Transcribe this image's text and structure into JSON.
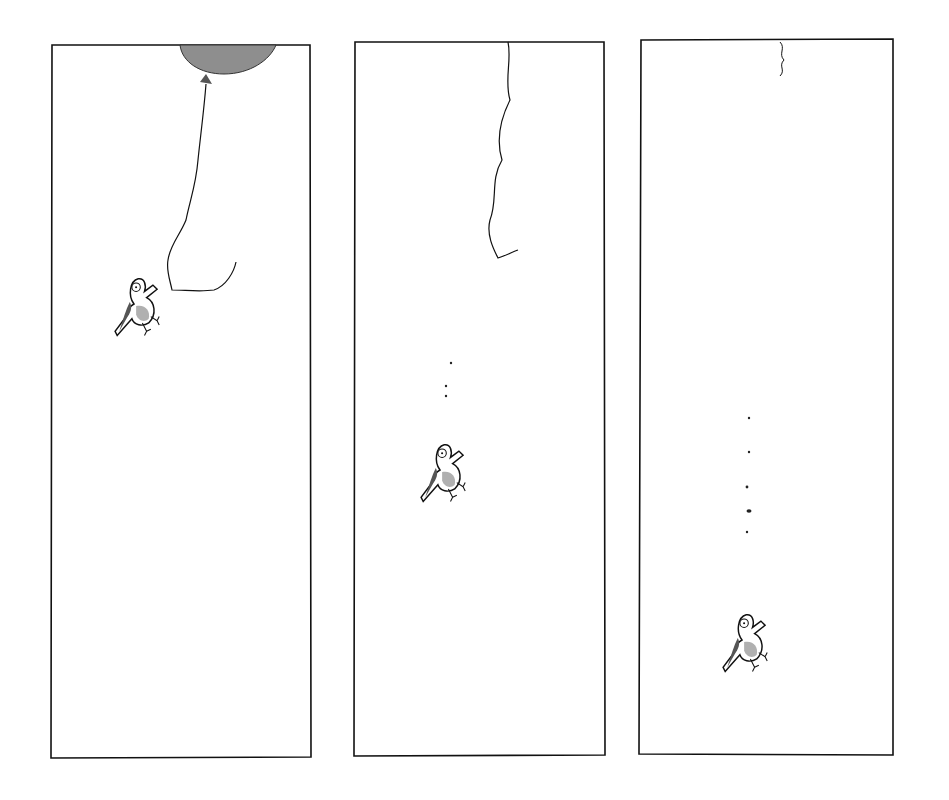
{
  "comic": {
    "panel_count": 3,
    "colors": {
      "ink": "#111111",
      "balloon": "#8e8e8e",
      "bird_wing": "#999999",
      "paper": "#ffffff"
    },
    "panels": [
      {
        "index": 1,
        "scene": "bird holding string of balloon",
        "has_balloon": true
      },
      {
        "index": 2,
        "scene": "bird falling, string floating up",
        "droppings": 3
      },
      {
        "index": 3,
        "scene": "bird fallen further, string nearly gone",
        "droppings": 5
      }
    ]
  }
}
